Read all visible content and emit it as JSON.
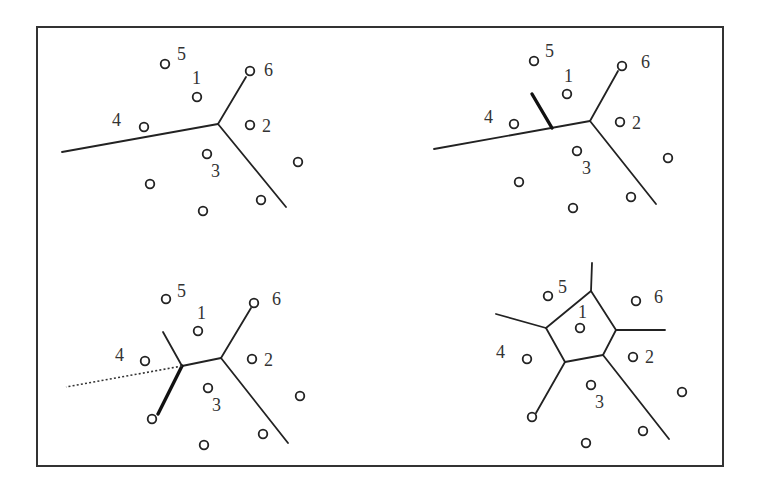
{
  "figure": {
    "frame": {
      "x": 37,
      "y": 27,
      "width": 686,
      "height": 439
    },
    "panels": [
      {
        "id": "top-left",
        "sites": [
          {
            "x": 165,
            "y": 64,
            "label": "5",
            "lx": 177,
            "ly": 60
          },
          {
            "x": 197,
            "y": 97,
            "label": "1",
            "lx": 192,
            "ly": 84
          },
          {
            "x": 250,
            "y": 71,
            "label": "6",
            "lx": 264,
            "ly": 76
          },
          {
            "x": 144,
            "y": 127,
            "label": "4",
            "lx": 112,
            "ly": 126
          },
          {
            "x": 250,
            "y": 125,
            "label": "2",
            "lx": 262,
            "ly": 132
          },
          {
            "x": 207,
            "y": 154,
            "label": "3",
            "lx": 211,
            "ly": 177
          },
          {
            "x": 298,
            "y": 162,
            "label": ""
          },
          {
            "x": 150,
            "y": 184,
            "label": ""
          },
          {
            "x": 261,
            "y": 200,
            "label": ""
          },
          {
            "x": 203,
            "y": 211,
            "label": ""
          }
        ],
        "edges": [
          {
            "x1": 62,
            "y1": 152,
            "x2": 218,
            "y2": 124,
            "style": "solid"
          },
          {
            "x1": 218,
            "y1": 124,
            "x2": 246,
            "y2": 77,
            "style": "solid"
          },
          {
            "x1": 218,
            "y1": 124,
            "x2": 286,
            "y2": 207,
            "style": "solid"
          }
        ]
      },
      {
        "id": "top-right",
        "sites": [
          {
            "x": 534,
            "y": 61,
            "label": "5",
            "lx": 545,
            "ly": 57
          },
          {
            "x": 567,
            "y": 94,
            "label": "1",
            "lx": 564,
            "ly": 82
          },
          {
            "x": 622,
            "y": 66,
            "label": "6",
            "lx": 641,
            "ly": 68
          },
          {
            "x": 514,
            "y": 124,
            "label": "4",
            "lx": 484,
            "ly": 123
          },
          {
            "x": 620,
            "y": 122,
            "label": "2",
            "lx": 632,
            "ly": 129
          },
          {
            "x": 577,
            "y": 151,
            "label": "3",
            "lx": 582,
            "ly": 174
          },
          {
            "x": 668,
            "y": 158,
            "label": ""
          },
          {
            "x": 519,
            "y": 182,
            "label": ""
          },
          {
            "x": 631,
            "y": 197,
            "label": ""
          },
          {
            "x": 573,
            "y": 208,
            "label": ""
          }
        ],
        "edges": [
          {
            "x1": 434,
            "y1": 149,
            "x2": 590,
            "y2": 121,
            "style": "solid"
          },
          {
            "x1": 590,
            "y1": 121,
            "x2": 618,
            "y2": 71,
            "style": "solid"
          },
          {
            "x1": 590,
            "y1": 121,
            "x2": 656,
            "y2": 204,
            "style": "solid"
          },
          {
            "x1": 552,
            "y1": 128,
            "x2": 532,
            "y2": 94,
            "style": "bold"
          }
        ]
      },
      {
        "id": "bottom-left",
        "sites": [
          {
            "x": 166,
            "y": 299,
            "label": "5",
            "lx": 177,
            "ly": 297
          },
          {
            "x": 198,
            "y": 331,
            "label": "1",
            "lx": 197,
            "ly": 319
          },
          {
            "x": 254,
            "y": 303,
            "label": "6",
            "lx": 272,
            "ly": 305
          },
          {
            "x": 145,
            "y": 361,
            "label": "4",
            "lx": 115,
            "ly": 361
          },
          {
            "x": 252,
            "y": 359,
            "label": "2",
            "lx": 264,
            "ly": 366
          },
          {
            "x": 208,
            "y": 388,
            "label": "3",
            "lx": 212,
            "ly": 411
          },
          {
            "x": 300,
            "y": 396,
            "label": ""
          },
          {
            "x": 152,
            "y": 419,
            "label": ""
          },
          {
            "x": 263,
            "y": 434,
            "label": ""
          },
          {
            "x": 204,
            "y": 445,
            "label": ""
          }
        ],
        "edges": [
          {
            "x1": 221,
            "y1": 358,
            "x2": 182,
            "y2": 366,
            "style": "solid"
          },
          {
            "x1": 221,
            "y1": 358,
            "x2": 251,
            "y2": 308,
            "style": "solid"
          },
          {
            "x1": 221,
            "y1": 358,
            "x2": 288,
            "y2": 443,
            "style": "solid"
          },
          {
            "x1": 182,
            "y1": 366,
            "x2": 163,
            "y2": 332,
            "style": "solid"
          },
          {
            "x1": 182,
            "y1": 366,
            "x2": 158,
            "y2": 414,
            "style": "bold"
          },
          {
            "x1": 182,
            "y1": 366,
            "x2": 66,
            "y2": 387,
            "style": "dotted"
          }
        ]
      },
      {
        "id": "bottom-right",
        "sites": [
          {
            "x": 548,
            "y": 296,
            "label": "5",
            "lx": 558,
            "ly": 293
          },
          {
            "x": 580,
            "y": 328,
            "label": "1",
            "lx": 578,
            "ly": 318
          },
          {
            "x": 636,
            "y": 301,
            "label": "6",
            "lx": 654,
            "ly": 303
          },
          {
            "x": 527,
            "y": 359,
            "label": "4",
            "lx": 496,
            "ly": 358
          },
          {
            "x": 633,
            "y": 357,
            "label": "2",
            "lx": 645,
            "ly": 363
          },
          {
            "x": 591,
            "y": 385,
            "label": "3",
            "lx": 595,
            "ly": 408
          },
          {
            "x": 682,
            "y": 392,
            "label": ""
          },
          {
            "x": 532,
            "y": 417,
            "label": ""
          },
          {
            "x": 643,
            "y": 431,
            "label": ""
          },
          {
            "x": 586,
            "y": 443,
            "label": ""
          }
        ],
        "edges": [
          {
            "x1": 591,
            "y1": 291,
            "x2": 616,
            "y2": 330,
            "style": "solid"
          },
          {
            "x1": 616,
            "y1": 330,
            "x2": 603,
            "y2": 355,
            "style": "solid"
          },
          {
            "x1": 603,
            "y1": 355,
            "x2": 565,
            "y2": 362,
            "style": "solid"
          },
          {
            "x1": 565,
            "y1": 362,
            "x2": 546,
            "y2": 328,
            "style": "solid"
          },
          {
            "x1": 546,
            "y1": 328,
            "x2": 591,
            "y2": 291,
            "style": "solid"
          },
          {
            "x1": 591,
            "y1": 291,
            "x2": 592,
            "y2": 263,
            "style": "solid"
          },
          {
            "x1": 546,
            "y1": 328,
            "x2": 496,
            "y2": 314,
            "style": "solid"
          },
          {
            "x1": 616,
            "y1": 330,
            "x2": 665,
            "y2": 330,
            "style": "solid"
          },
          {
            "x1": 565,
            "y1": 362,
            "x2": 536,
            "y2": 413,
            "style": "solid"
          },
          {
            "x1": 603,
            "y1": 355,
            "x2": 669,
            "y2": 439,
            "style": "solid"
          }
        ]
      }
    ]
  }
}
